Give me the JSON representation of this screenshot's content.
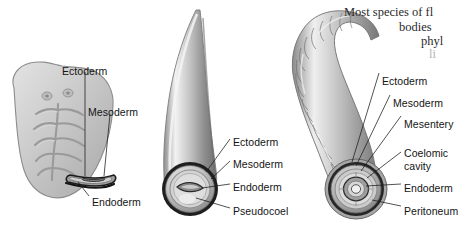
{
  "figure": {
    "background_color": "#ffffff",
    "label_color": "#141414",
    "body_text_color": "#2a2a2a"
  },
  "body_text": {
    "lines": [
      "Most species of fl",
      "bodies",
      "phyl",
      "li"
    ]
  },
  "panels": [
    {
      "name": "acoelomate-flatworm",
      "labels": [
        {
          "text": "Ectoderm",
          "x": 62,
          "y": 66
        },
        {
          "text": "Mesoderm",
          "x": 88,
          "y": 107
        },
        {
          "text": "Endoderm",
          "x": 92,
          "y": 197
        }
      ]
    },
    {
      "name": "pseudocoelomate-roundworm",
      "labels": [
        {
          "text": "Ectoderm",
          "x": 233,
          "y": 137
        },
        {
          "text": "Mesoderm",
          "x": 233,
          "y": 159
        },
        {
          "text": "Endoderm",
          "x": 233,
          "y": 182
        },
        {
          "text": "Pseudocoel",
          "x": 233,
          "y": 206
        }
      ]
    },
    {
      "name": "coelomate-earthworm",
      "labels": [
        {
          "text": "Ectoderm",
          "x": 382,
          "y": 76
        },
        {
          "text": "Mesoderm",
          "x": 393,
          "y": 98
        },
        {
          "text": "Mesentery",
          "x": 404,
          "y": 119
        },
        {
          "text": "Coelomic",
          "x": 404,
          "y": 148
        },
        {
          "text": "cavity",
          "x": 404,
          "y": 161
        },
        {
          "text": "Endoderm",
          "x": 404,
          "y": 183
        },
        {
          "text": "Peritoneum",
          "x": 404,
          "y": 206
        }
      ]
    }
  ]
}
